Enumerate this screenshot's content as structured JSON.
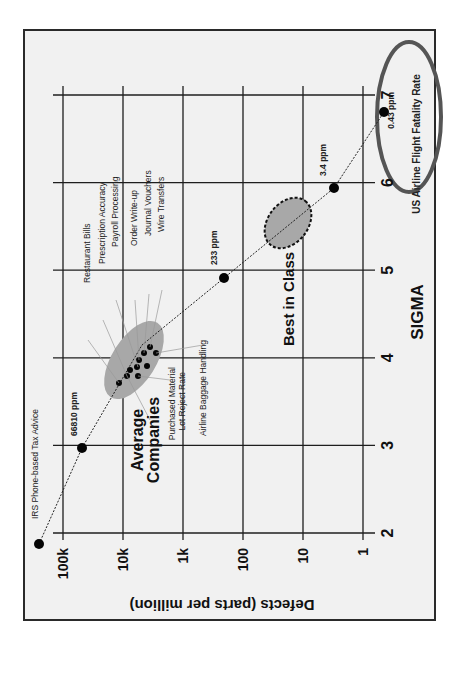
{
  "chart_data": {
    "type": "scatter",
    "orientation": "rotated-90-ccw",
    "title": "",
    "xlabel": "SIGMA",
    "ylabel": "Defects (parts per million)",
    "x_ticks": [
      2,
      3,
      4,
      5,
      6,
      7
    ],
    "y_ticks": [
      {
        "value": 100000,
        "label": "100k"
      },
      {
        "value": 10000,
        "label": "10k"
      },
      {
        "value": 1000,
        "label": "1k"
      },
      {
        "value": 100,
        "label": "100"
      },
      {
        "value": 10,
        "label": "10"
      },
      {
        "value": 1,
        "label": "1"
      }
    ],
    "xlim": [
      2,
      7
    ],
    "ylim_log": [
      1,
      100000
    ],
    "y_scale": "log",
    "grid": true,
    "series": [
      {
        "name": "Sigma curve",
        "points": [
          {
            "sigma": 2.05,
            "ppm": 250000,
            "label": "IRS Phone-based Tax Advice",
            "label_bold": false
          },
          {
            "sigma": 3.0,
            "ppm": 66810,
            "label": "66810 ppm",
            "label_bold": true
          },
          {
            "sigma": 5.0,
            "ppm": 233,
            "label": "233 ppm",
            "label_bold": true
          },
          {
            "sigma": 6.0,
            "ppm": 3.4,
            "label": "3.4 ppm",
            "label_bold": true
          },
          {
            "sigma": 6.4,
            "ppm": 0.43,
            "label": "0.43 ppm",
            "label_bold": true
          }
        ]
      },
      {
        "name": "Average Companies cluster",
        "points": [
          {
            "sigma": 3.7,
            "ppm": 11000
          },
          {
            "sigma": 3.8,
            "ppm": 8500
          },
          {
            "sigma": 3.8,
            "ppm": 7000
          },
          {
            "sigma": 3.9,
            "ppm": 7200
          },
          {
            "sigma": 3.95,
            "ppm": 6800
          },
          {
            "sigma": 3.85,
            "ppm": 5500
          },
          {
            "sigma": 4.1,
            "ppm": 6000
          },
          {
            "sigma": 4.1,
            "ppm": 4500
          },
          {
            "sigma": 4.2,
            "ppm": 4000
          },
          {
            "sigma": 4.15,
            "ppm": 3500
          }
        ]
      }
    ],
    "annotations": [
      {
        "text": "Restaurant Bills"
      },
      {
        "text": "Prescription Accuracy"
      },
      {
        "text": "Payroll Processing"
      },
      {
        "text": "Order Write-up"
      },
      {
        "text": "Journal Vouchers"
      },
      {
        "text": "Wire Transfers"
      },
      {
        "text": "Airline Baggage Handling"
      },
      {
        "text": "Purchased Material"
      },
      {
        "text": "Lot Reject Rate"
      },
      {
        "text": "Average"
      },
      {
        "text": "Companies"
      },
      {
        "text": "Best in Class"
      },
      {
        "text": "US Airline Flight Fatality Rate"
      }
    ],
    "regions": [
      {
        "name": "Average Companies",
        "style": "gray filled ellipse",
        "sigma_range": [
          3.6,
          4.3
        ]
      },
      {
        "name": "Best in Class",
        "style": "gray filled dashed ellipse",
        "sigma_range": [
          5.4,
          5.9
        ]
      },
      {
        "name": "US Airline Flight Fatality Rate",
        "style": "outlined ellipse",
        "sigma_range": [
          5.6,
          7.3
        ]
      }
    ]
  },
  "colors": {
    "background": "#f1f1f1",
    "grid": "#1e1e1e",
    "ellipse_fill": "#a8a8a8",
    "highlight_ring": "#555555"
  }
}
